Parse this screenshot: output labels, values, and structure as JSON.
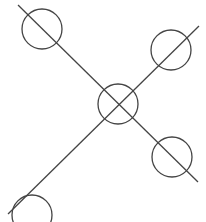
{
  "diagram": {
    "background": "#ffffff",
    "stroke_color": "#444444",
    "lines": [
      {
        "name": "diagonal-line-down",
        "x1": 18,
        "y1": 5,
        "x2": 198,
        "y2": 182
      },
      {
        "name": "diagonal-line-up",
        "x1": 8,
        "y1": 214,
        "x2": 199,
        "y2": 26
      }
    ],
    "circles": [
      {
        "name": "circle-top-left",
        "cx": 42,
        "cy": 29,
        "r": 20
      },
      {
        "name": "circle-top-right",
        "cx": 171,
        "cy": 50,
        "r": 20
      },
      {
        "name": "circle-center",
        "cx": 118,
        "cy": 104,
        "r": 20
      },
      {
        "name": "circle-bottom-right",
        "cx": 172,
        "cy": 157,
        "r": 20
      },
      {
        "name": "circle-bottom-left",
        "cx": 32,
        "cy": 215,
        "r": 20
      }
    ]
  }
}
